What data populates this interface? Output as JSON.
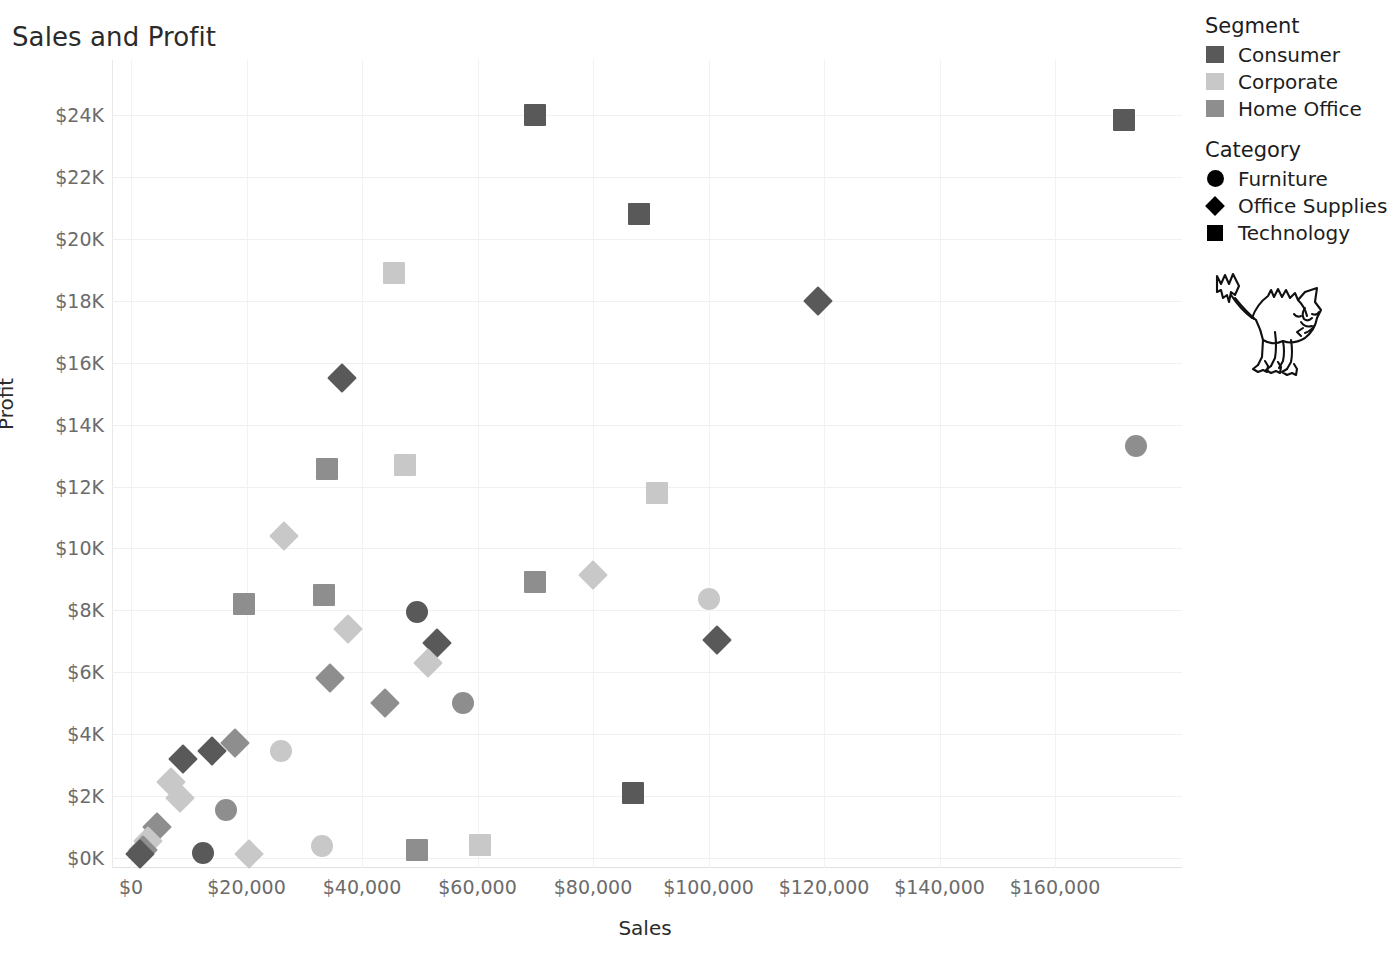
{
  "chart_data": {
    "type": "scatter",
    "title": "Sales and Profit",
    "xlabel": "Sales",
    "ylabel": "Profit",
    "xlim": [
      -8000,
      185000
    ],
    "ylim": [
      -600,
      25000
    ],
    "grid": true,
    "legend_position": "right",
    "x_ticks": [
      {
        "label": "$0",
        "value": 0
      },
      {
        "label": "$20,000",
        "value": 20000
      },
      {
        "label": "$40,000",
        "value": 40000
      },
      {
        "label": "$60,000",
        "value": 60000
      },
      {
        "label": "$80,000",
        "value": 80000
      },
      {
        "label": "$100,000",
        "value": 100000
      },
      {
        "label": "$120,000",
        "value": 120000
      },
      {
        "label": "$140,000",
        "value": 140000
      },
      {
        "label": "$160,000",
        "value": 160000
      }
    ],
    "y_ticks": [
      {
        "label": "$0K",
        "value": 0
      },
      {
        "label": "$2K",
        "value": 2000
      },
      {
        "label": "$4K",
        "value": 4000
      },
      {
        "label": "$6K",
        "value": 6000
      },
      {
        "label": "$8K",
        "value": 8000
      },
      {
        "label": "$10K",
        "value": 10000
      },
      {
        "label": "$12K",
        "value": 12000
      },
      {
        "label": "$14K",
        "value": 14000
      },
      {
        "label": "$16K",
        "value": 16000
      },
      {
        "label": "$18K",
        "value": 18000
      },
      {
        "label": "$20K",
        "value": 20000
      },
      {
        "label": "$22K",
        "value": 22000
      },
      {
        "label": "$24K",
        "value": 24000
      }
    ],
    "color_encoding": "Segment",
    "shape_encoding": "Category",
    "colors": {
      "Consumer": "#595959",
      "Corporate": "#c8c8c8",
      "Home Office": "#8e8e8e"
    },
    "shapes": {
      "Furniture": "circle",
      "Office Supplies": "diamond",
      "Technology": "square"
    },
    "points": [
      {
        "x": 70000,
        "y": 24000,
        "segment": "Consumer",
        "category": "Technology"
      },
      {
        "x": 172000,
        "y": 23850,
        "segment": "Consumer",
        "category": "Technology"
      },
      {
        "x": 88000,
        "y": 20800,
        "segment": "Consumer",
        "category": "Technology"
      },
      {
        "x": 45500,
        "y": 18900,
        "segment": "Corporate",
        "category": "Technology"
      },
      {
        "x": 119000,
        "y": 18000,
        "segment": "Consumer",
        "category": "Office Supplies"
      },
      {
        "x": 36500,
        "y": 15500,
        "segment": "Consumer",
        "category": "Office Supplies"
      },
      {
        "x": 34000,
        "y": 12550,
        "segment": "Home Office",
        "category": "Technology"
      },
      {
        "x": 47500,
        "y": 12700,
        "segment": "Corporate",
        "category": "Technology"
      },
      {
        "x": 91000,
        "y": 11800,
        "segment": "Corporate",
        "category": "Technology"
      },
      {
        "x": 174000,
        "y": 13300,
        "segment": "Home Office",
        "category": "Furniture"
      },
      {
        "x": 26500,
        "y": 10400,
        "segment": "Corporate",
        "category": "Office Supplies"
      },
      {
        "x": 80000,
        "y": 9150,
        "segment": "Corporate",
        "category": "Office Supplies"
      },
      {
        "x": 70000,
        "y": 8900,
        "segment": "Home Office",
        "category": "Technology"
      },
      {
        "x": 100000,
        "y": 8350,
        "segment": "Corporate",
        "category": "Furniture"
      },
      {
        "x": 19500,
        "y": 8200,
        "segment": "Home Office",
        "category": "Technology"
      },
      {
        "x": 33500,
        "y": 8500,
        "segment": "Home Office",
        "category": "Technology"
      },
      {
        "x": 49500,
        "y": 7950,
        "segment": "Consumer",
        "category": "Furniture"
      },
      {
        "x": 37500,
        "y": 7400,
        "segment": "Corporate",
        "category": "Office Supplies"
      },
      {
        "x": 53000,
        "y": 6950,
        "segment": "Consumer",
        "category": "Office Supplies"
      },
      {
        "x": 101500,
        "y": 7050,
        "segment": "Consumer",
        "category": "Office Supplies"
      },
      {
        "x": 51500,
        "y": 6300,
        "segment": "Corporate",
        "category": "Office Supplies"
      },
      {
        "x": 34500,
        "y": 5800,
        "segment": "Home Office",
        "category": "Office Supplies"
      },
      {
        "x": 44000,
        "y": 5000,
        "segment": "Home Office",
        "category": "Office Supplies"
      },
      {
        "x": 57500,
        "y": 5000,
        "segment": "Home Office",
        "category": "Furniture"
      },
      {
        "x": 18000,
        "y": 3700,
        "segment": "Home Office",
        "category": "Office Supplies"
      },
      {
        "x": 14000,
        "y": 3450,
        "segment": "Consumer",
        "category": "Office Supplies"
      },
      {
        "x": 9000,
        "y": 3200,
        "segment": "Consumer",
        "category": "Office Supplies"
      },
      {
        "x": 26000,
        "y": 3450,
        "segment": "Corporate",
        "category": "Furniture"
      },
      {
        "x": 7000,
        "y": 2450,
        "segment": "Corporate",
        "category": "Office Supplies"
      },
      {
        "x": 87000,
        "y": 2100,
        "segment": "Consumer",
        "category": "Technology"
      },
      {
        "x": 8500,
        "y": 1950,
        "segment": "Corporate",
        "category": "Office Supplies"
      },
      {
        "x": 16500,
        "y": 1550,
        "segment": "Home Office",
        "category": "Furniture"
      },
      {
        "x": 4500,
        "y": 1000,
        "segment": "Home Office",
        "category": "Office Supplies"
      },
      {
        "x": 3000,
        "y": 550,
        "segment": "Corporate",
        "category": "Office Supplies"
      },
      {
        "x": 2000,
        "y": 250,
        "segment": "Home Office",
        "category": "Office Supplies"
      },
      {
        "x": 1500,
        "y": 120,
        "segment": "Consumer",
        "category": "Office Supplies"
      },
      {
        "x": 12500,
        "y": 150,
        "segment": "Consumer",
        "category": "Furniture"
      },
      {
        "x": 20500,
        "y": 120,
        "segment": "Corporate",
        "category": "Office Supplies"
      },
      {
        "x": 33000,
        "y": 400,
        "segment": "Corporate",
        "category": "Furniture"
      },
      {
        "x": 49500,
        "y": 250,
        "segment": "Home Office",
        "category": "Technology"
      },
      {
        "x": 60500,
        "y": 420,
        "segment": "Corporate",
        "category": "Technology"
      }
    ]
  },
  "legend": {
    "segment": {
      "title": "Segment",
      "items": [
        {
          "label": "Consumer",
          "color": "#595959"
        },
        {
          "label": "Corporate",
          "color": "#c8c8c8"
        },
        {
          "label": "Home Office",
          "color": "#8e8e8e"
        }
      ]
    },
    "category": {
      "title": "Category",
      "items": [
        {
          "label": "Furniture",
          "shape": "circle"
        },
        {
          "label": "Office Supplies",
          "shape": "diamond"
        },
        {
          "label": "Technology",
          "shape": "square"
        }
      ]
    }
  },
  "watermark": {
    "name": "cat-illustration"
  }
}
